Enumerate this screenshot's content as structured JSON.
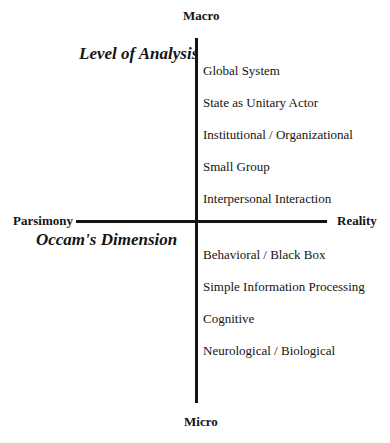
{
  "diagram": {
    "top_label": "Macro",
    "bottom_label": "Micro",
    "left_label": "Parsimony",
    "right_label": "Reality",
    "vertical_axis_title": "Level of Analysis",
    "horizontal_axis_title": "Occam's Dimension",
    "levels_upper": [
      "Global System",
      "State as Unitary Actor",
      "Institutional / Organizational",
      "Small Group",
      "Interpersonal Interaction"
    ],
    "levels_lower": [
      "Behavioral / Black Box",
      "Simple Information Processing",
      "Cognitive",
      "Neurological / Biological"
    ]
  }
}
